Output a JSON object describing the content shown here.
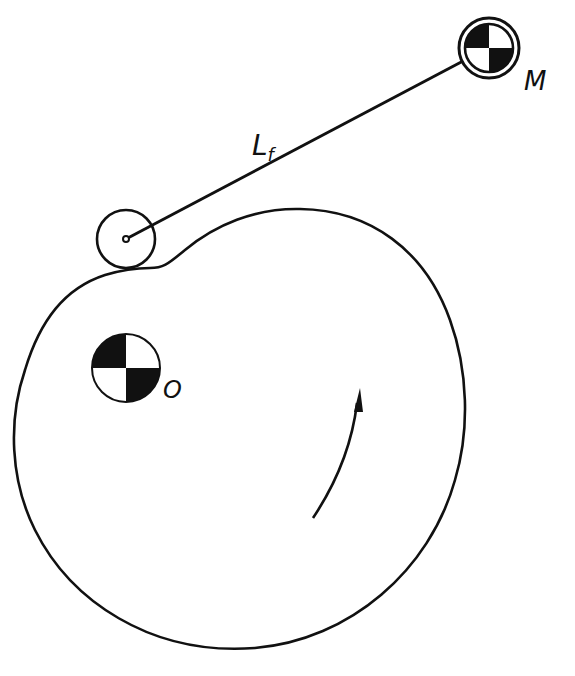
{
  "diagram": {
    "stroke_color": "#111111",
    "background_color": "#ffffff",
    "labels": {
      "follower_mass": "M",
      "cam_center": "O",
      "follower_length_main": "L",
      "follower_length_sub": "f"
    },
    "elements": [
      {
        "name": "cam-profile",
        "description": "irregular closed cam outline"
      },
      {
        "name": "roller-follower",
        "description": "small circle with pivot dot contacting cam"
      },
      {
        "name": "follower-arm",
        "description": "straight link of length L_f from roller to mass M"
      },
      {
        "name": "mass-center-symbol-M",
        "description": "center-of-mass symbol with outer ring"
      },
      {
        "name": "mass-center-symbol-O",
        "description": "center-of-mass symbol at cam rotation center"
      },
      {
        "name": "rotation-arrow",
        "description": "curved arrow indicating counter-clockwise cam rotation"
      }
    ]
  }
}
